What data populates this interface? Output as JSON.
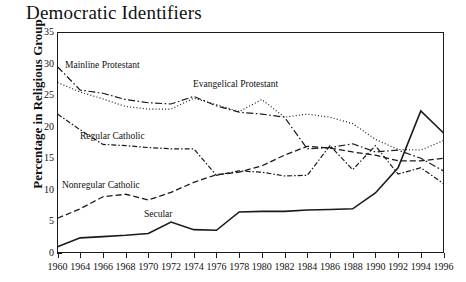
{
  "chart_data": {
    "type": "line",
    "title": "Democratic Identifiers",
    "xlabel": "",
    "ylabel": "Percentage in Religious Group",
    "ylim": [
      0,
      35
    ],
    "yticks": [
      0,
      5,
      10,
      15,
      20,
      25,
      30,
      35
    ],
    "grid": false,
    "legend_position": "inline-annotations",
    "x": [
      1960,
      1964,
      1966,
      1968,
      1970,
      1972,
      1974,
      1976,
      1978,
      1980,
      1982,
      1984,
      1986,
      1988,
      1990,
      1992,
      1994,
      1996
    ],
    "categories": [
      "1960",
      "1964",
      "1966",
      "1968",
      "1970",
      "1972",
      "1974",
      "1976",
      "1978",
      "1980",
      "1982",
      "1984",
      "1986",
      "1988",
      "1990",
      "1992",
      "1994",
      "1996"
    ],
    "series": [
      {
        "name": "Mainline Protestant",
        "style": "dash-dot",
        "values": [
          29.5,
          25.8,
          25.3,
          24.3,
          23.8,
          23.6,
          24.8,
          23.3,
          22.3,
          22.0,
          21.5,
          16.5,
          16.7,
          17.3,
          16.0,
          16.3,
          15.0,
          13.0
        ]
      },
      {
        "name": "Evangelical Protestant",
        "style": "dotted",
        "values": [
          27.0,
          25.5,
          24.4,
          23.2,
          22.8,
          22.8,
          24.5,
          23.5,
          22.4,
          24.3,
          21.5,
          22.0,
          21.5,
          20.5,
          18.0,
          16.4,
          16.3,
          17.8
        ]
      },
      {
        "name": "Regular Catholic",
        "style": "long-dash",
        "values": [
          22.0,
          19.5,
          17.2,
          17.0,
          16.7,
          16.5,
          16.5,
          12.3,
          13.0,
          12.8,
          12.2,
          12.3,
          17.0,
          13.2,
          17.0,
          12.5,
          13.5,
          11.0
        ]
      },
      {
        "name": "Nonregular Catholic",
        "style": "dash-dot-thin",
        "values": [
          5.5,
          7.0,
          8.9,
          9.3,
          8.4,
          9.6,
          11.2,
          12.4,
          12.8,
          13.8,
          15.5,
          16.9,
          16.6,
          16.0,
          15.5,
          14.6,
          14.6,
          15.0
        ]
      },
      {
        "name": "Secular",
        "style": "solid",
        "values": [
          1.0,
          2.4,
          2.6,
          2.8,
          3.1,
          4.9,
          3.7,
          3.6,
          6.5,
          6.6,
          6.6,
          6.8,
          6.9,
          7.0,
          9.5,
          13.5,
          22.5,
          19.0
        ]
      }
    ],
    "annotations": [
      {
        "label": "Mainline Protestant",
        "x_px": 65,
        "y_px": 60
      },
      {
        "label": "Evangelical Protestant",
        "x_px": 193,
        "y_px": 79
      },
      {
        "label": "Regular Catholic",
        "x_px": 80,
        "y_px": 131
      },
      {
        "label": "Nonregular Catholic",
        "x_px": 62,
        "y_px": 180
      },
      {
        "label": "Secular",
        "x_px": 144,
        "y_px": 209
      }
    ],
    "colors": {
      "line": "#1a1a1a",
      "axis": "#1a1a1a",
      "background": "#ffffff",
      "text": "#111111"
    }
  }
}
